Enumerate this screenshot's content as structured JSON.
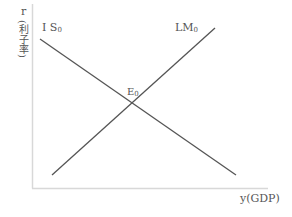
{
  "diagram": {
    "y_axis": {
      "label": "r",
      "sublabel": "(利子率)"
    },
    "x_axis": {
      "label": "y(GDP)"
    },
    "curves": [
      {
        "name": "IS",
        "label": "I S",
        "subscript": "0",
        "slope": "downward",
        "from": [
          40,
          39
        ],
        "to": [
          236,
          175
        ]
      },
      {
        "name": "LM",
        "label": "LM",
        "subscript": "0",
        "slope": "upward",
        "from": [
          52,
          175
        ],
        "to": [
          215,
          28
        ]
      }
    ],
    "equilibrium": {
      "label": "E",
      "subscript": "0",
      "point": [
        133,
        103
      ]
    },
    "colors": {
      "axis": "#d8d8d8",
      "line": "#555555",
      "text": "#555555"
    }
  }
}
